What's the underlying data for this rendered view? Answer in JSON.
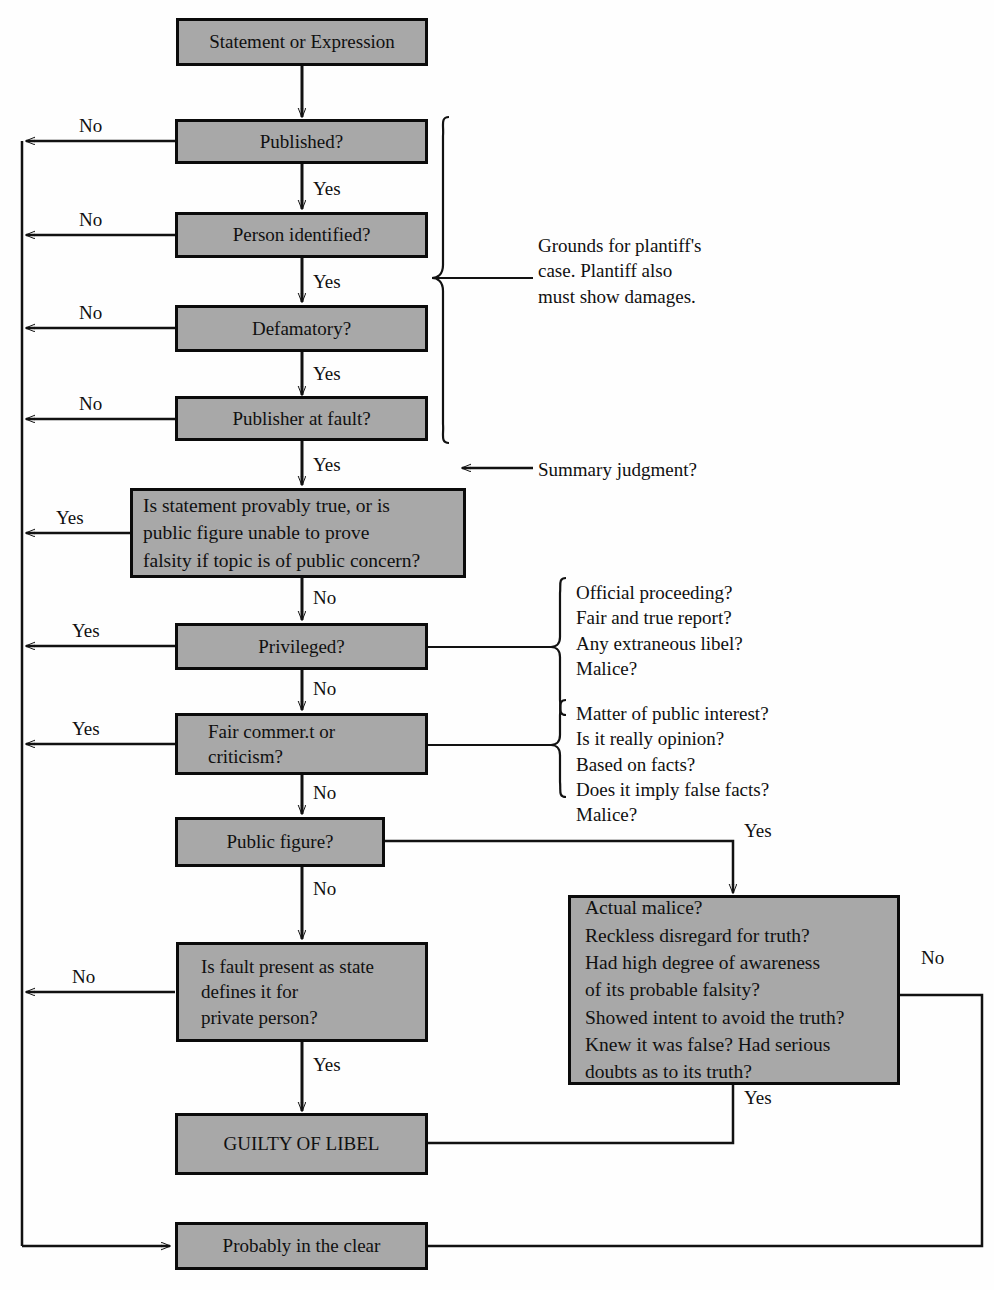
{
  "diagram": {
    "colors": {
      "box_fill": "#a8a8a8",
      "box_border": "#0b0b0b",
      "line": "#121212",
      "text": "#101010"
    },
    "nodes": {
      "statement": "Statement or Expression",
      "published": "Published?",
      "person_identified": "Person identified?",
      "defamatory": "Defamatory?",
      "publisher_at_fault": "Publisher at fault?",
      "provably_true": "Is statement provably true, or is\npublic figure unable to prove\nfalsity if topic is of public concern?",
      "privileged": "Privileged?",
      "fair_comment": "Fair commer.t or\ncriticism?",
      "public_figure": "Public figure?",
      "actual_malice": "Actual malice?\nReckless disregard for truth?\nHad high degree of awareness\nof its probable falsity?\nShowed intent to avoid the truth?\nKnew it was false? Had serious\ndoubts as to its truth?",
      "state_fault": "Is fault present as state\ndefines it for\nprivate person?",
      "guilty": "GUILTY OF LIBEL",
      "clear": "Probably in the clear"
    },
    "edge_labels": {
      "no_published": "No",
      "no_person": "No",
      "no_defamatory": "No",
      "no_publisher": "No",
      "yes_published": "Yes",
      "yes_person": "Yes",
      "yes_defamatory": "Yes",
      "yes_publisher": "Yes",
      "yes_provably_true": "Yes",
      "no_provably_true": "No",
      "yes_privileged": "Yes",
      "no_privileged": "No",
      "yes_fair_comment": "Yes",
      "no_fair_comment": "No",
      "yes_public_figure": "Yes",
      "no_public_figure": "No",
      "no_state_fault": "No",
      "yes_state_fault": "Yes",
      "no_malice": "No",
      "yes_malice": "Yes"
    },
    "annotations": {
      "grounds": "Grounds for plantiff's\ncase. Plantiff also\nmust show damages.",
      "summary_judgment": "Summary judgment?",
      "privileged_tests": "Official proceeding?\nFair and true report?\nAny extraneous libel?\nMalice?",
      "fair_comment_tests": "Matter of public interest?\nIs it really opinion?\nBased on facts?\nDoes it imply false facts?\nMalice?"
    }
  }
}
